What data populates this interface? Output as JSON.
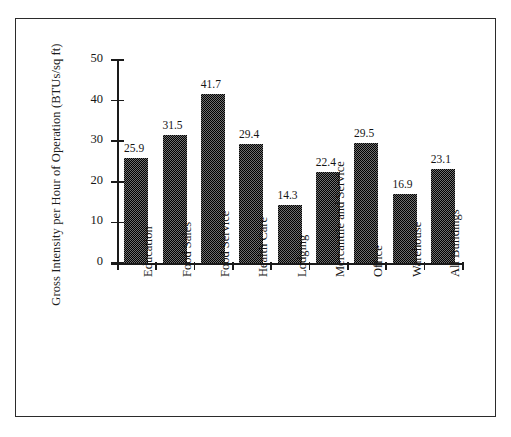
{
  "chart_data": {
    "type": "bar",
    "title": "",
    "subtitle": "",
    "xlabel": "",
    "ylabel": "Gross Intensity per Hour of Operation (BTUs/sq ft)",
    "ylim": [
      0,
      50
    ],
    "yticks": [
      "0",
      "10",
      "20",
      "30",
      "40",
      "50"
    ],
    "ytick_values": [
      0,
      10,
      20,
      30,
      40,
      50
    ],
    "grid": false,
    "legend": false,
    "legend_position": "none",
    "value_labels_shown": true,
    "bar_color": "#6f6f6f",
    "bar_pattern": "50% checkerboard dither (black on white)",
    "axis_color": "#1a1a1a",
    "border_color": "#2b2b2b",
    "background_color": "#ffffff",
    "categories": [
      "Education",
      "Food Sales",
      "Food Service",
      "Health Care",
      "Lodging",
      "Mercantile and Service",
      "Office",
      "Warehouse",
      "All Buildings"
    ],
    "values": [
      25.9,
      31.5,
      41.7,
      29.4,
      14.3,
      22.4,
      29.5,
      16.9,
      23.1
    ],
    "value_labels": [
      "25.9",
      "31.5",
      "41.7",
      "29.4",
      "14.3",
      "22.4",
      "29.5",
      "16.9",
      "23.1"
    ]
  }
}
